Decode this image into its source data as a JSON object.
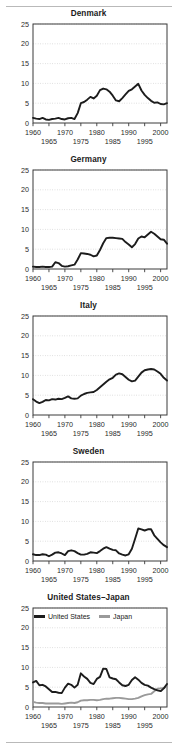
{
  "figure": {
    "background": "#ffffff",
    "rule_color": "#b9b9b9",
    "series_colors": {
      "primary": "#1c1c1c",
      "secondary": "#9a9a9a"
    }
  },
  "legend": {
    "united_states_label": "United States",
    "japan_label": "Japan"
  },
  "axes": {
    "y_ticks": [
      "0",
      "5",
      "10",
      "15",
      "20",
      "25"
    ],
    "x_ticks_upper": [
      "1960",
      "1970",
      "1980",
      "1990",
      "2000"
    ],
    "x_ticks_lower": [
      "1965",
      "1975",
      "1985",
      "1995"
    ]
  },
  "titles": {
    "denmark": "Denmark",
    "germany": "Germany",
    "italy": "Italy",
    "sweden": "Sweden",
    "us_japan": "United States–Japan"
  },
  "chart_data": [
    {
      "type": "line",
      "title": "Denmark",
      "xlabel": "",
      "ylabel": "",
      "xlim": [
        1960,
        2002
      ],
      "ylim": [
        0,
        25
      ],
      "grid": true,
      "legend_position": "none",
      "x": [
        1960,
        1961,
        1962,
        1963,
        1964,
        1965,
        1966,
        1967,
        1968,
        1969,
        1970,
        1971,
        1972,
        1973,
        1974,
        1975,
        1976,
        1977,
        1978,
        1979,
        1980,
        1981,
        1982,
        1983,
        1984,
        1985,
        1986,
        1987,
        1988,
        1989,
        1990,
        1991,
        1992,
        1993,
        1994,
        1995,
        1996,
        1997,
        1998,
        1999,
        2000,
        2001,
        2002
      ],
      "series": [
        {
          "name": "Denmark",
          "color": "#1c1c1c",
          "values": [
            1.3,
            1.1,
            1.0,
            1.3,
            0.9,
            0.8,
            1.0,
            1.1,
            1.3,
            1.0,
            0.9,
            1.2,
            1.3,
            1.0,
            2.5,
            5.0,
            5.3,
            5.9,
            6.6,
            6.2,
            6.9,
            8.3,
            8.7,
            8.5,
            7.9,
            6.9,
            5.7,
            5.5,
            6.3,
            7.2,
            8.1,
            8.5,
            9.2,
            9.9,
            8.2,
            7.1,
            6.3,
            5.6,
            5.1,
            5.2,
            4.8,
            4.7,
            5.0
          ]
        }
      ]
    },
    {
      "type": "line",
      "title": "Germany",
      "xlabel": "",
      "ylabel": "",
      "xlim": [
        1960,
        2002
      ],
      "ylim": [
        0,
        25
      ],
      "grid": true,
      "legend_position": "none",
      "x": [
        1960,
        1961,
        1962,
        1963,
        1964,
        1965,
        1966,
        1967,
        1968,
        1969,
        1970,
        1971,
        1972,
        1973,
        1974,
        1975,
        1976,
        1977,
        1978,
        1979,
        1980,
        1981,
        1982,
        1983,
        1984,
        1985,
        1986,
        1987,
        1988,
        1989,
        1990,
        1991,
        1992,
        1993,
        1994,
        1995,
        1996,
        1997,
        1998,
        1999,
        2000,
        2001,
        2002
      ],
      "series": [
        {
          "name": "Germany",
          "color": "#1c1c1c",
          "values": [
            0.6,
            0.5,
            0.5,
            0.6,
            0.5,
            0.5,
            0.6,
            1.7,
            1.5,
            0.8,
            0.6,
            0.7,
            0.9,
            1.1,
            2.4,
            4.0,
            3.9,
            3.8,
            3.6,
            3.2,
            3.4,
            4.8,
            6.5,
            7.8,
            7.9,
            7.9,
            7.8,
            7.7,
            7.6,
            6.8,
            6.2,
            5.5,
            6.3,
            7.7,
            8.2,
            8.0,
            8.7,
            9.4,
            8.9,
            8.2,
            7.5,
            7.4,
            6.4
          ]
        }
      ]
    },
    {
      "type": "line",
      "title": "Italy",
      "xlabel": "",
      "ylabel": "",
      "xlim": [
        1960,
        2002
      ],
      "ylim": [
        0,
        25
      ],
      "grid": true,
      "legend_position": "none",
      "x": [
        1960,
        1961,
        1962,
        1963,
        1964,
        1965,
        1966,
        1967,
        1968,
        1969,
        1970,
        1971,
        1972,
        1973,
        1974,
        1975,
        1976,
        1977,
        1978,
        1979,
        1980,
        1981,
        1982,
        1983,
        1984,
        1985,
        1986,
        1987,
        1988,
        1989,
        1990,
        1991,
        1992,
        1993,
        1994,
        1995,
        1996,
        1997,
        1998,
        1999,
        2000,
        2001,
        2002
      ],
      "series": [
        {
          "name": "Italy",
          "color": "#1c1c1c",
          "values": [
            4.0,
            3.4,
            3.0,
            3.3,
            3.8,
            3.7,
            4.0,
            3.9,
            4.1,
            4.0,
            4.3,
            4.7,
            4.2,
            4.1,
            4.2,
            4.9,
            5.3,
            5.6,
            5.7,
            5.8,
            6.3,
            7.0,
            7.7,
            8.4,
            9.0,
            9.4,
            10.2,
            10.5,
            10.3,
            9.6,
            8.9,
            8.5,
            8.7,
            9.7,
            10.7,
            11.3,
            11.5,
            11.6,
            11.5,
            11.0,
            10.4,
            9.4,
            8.7
          ]
        }
      ]
    },
    {
      "type": "line",
      "title": "Sweden",
      "xlabel": "",
      "ylabel": "",
      "xlim": [
        1960,
        2002
      ],
      "ylim": [
        0,
        25
      ],
      "grid": true,
      "legend_position": "none",
      "x": [
        1960,
        1961,
        1962,
        1963,
        1964,
        1965,
        1966,
        1967,
        1968,
        1969,
        1970,
        1971,
        1972,
        1973,
        1974,
        1975,
        1976,
        1977,
        1978,
        1979,
        1980,
        1981,
        1982,
        1983,
        1984,
        1985,
        1986,
        1987,
        1988,
        1989,
        1990,
        1991,
        1992,
        1993,
        1994,
        1995,
        1996,
        1997,
        1998,
        1999,
        2000,
        2001,
        2002
      ],
      "series": [
        {
          "name": "Sweden",
          "color": "#1c1c1c",
          "values": [
            1.7,
            1.5,
            1.5,
            1.7,
            1.6,
            1.2,
            1.6,
            2.1,
            2.2,
            1.9,
            1.5,
            2.5,
            2.7,
            2.5,
            2.0,
            1.6,
            1.6,
            1.8,
            2.2,
            2.1,
            2.0,
            2.5,
            3.1,
            3.5,
            3.1,
            2.8,
            2.7,
            1.9,
            1.6,
            1.4,
            1.7,
            3.1,
            5.6,
            8.2,
            8.0,
            7.7,
            8.0,
            8.0,
            6.5,
            5.6,
            4.7,
            4.0,
            3.5
          ]
        }
      ]
    },
    {
      "type": "line",
      "title": "United States–Japan",
      "xlabel": "",
      "ylabel": "",
      "xlim": [
        1960,
        2002
      ],
      "ylim": [
        0,
        25
      ],
      "grid": true,
      "legend_position": "top-left",
      "x": [
        1960,
        1961,
        1962,
        1963,
        1964,
        1965,
        1966,
        1967,
        1968,
        1969,
        1970,
        1971,
        1972,
        1973,
        1974,
        1975,
        1976,
        1977,
        1978,
        1979,
        1980,
        1981,
        1982,
        1983,
        1984,
        1985,
        1986,
        1987,
        1988,
        1989,
        1990,
        1991,
        1992,
        1993,
        1994,
        1995,
        1996,
        1997,
        1998,
        1999,
        2000,
        2001,
        2002
      ],
      "series": [
        {
          "name": "United States",
          "color": "#1c1c1c",
          "values": [
            6.2,
            6.6,
            5.5,
            5.6,
            5.2,
            4.5,
            3.8,
            3.8,
            3.6,
            3.5,
            4.9,
            5.9,
            5.6,
            4.9,
            5.6,
            8.5,
            7.7,
            7.1,
            6.1,
            5.8,
            7.1,
            7.6,
            9.7,
            9.6,
            7.5,
            7.2,
            7.0,
            6.2,
            5.5,
            5.3,
            5.6,
            6.8,
            7.5,
            6.9,
            6.1,
            5.6,
            5.4,
            4.9,
            4.5,
            4.2,
            4.0,
            4.7,
            5.8
          ]
        },
        {
          "name": "Japan",
          "color": "#9a9a9a",
          "values": [
            1.3,
            1.1,
            1.0,
            1.0,
            0.9,
            0.9,
            0.9,
            0.9,
            0.9,
            0.8,
            0.9,
            1.0,
            1.1,
            1.0,
            1.2,
            1.6,
            1.7,
            1.7,
            1.8,
            1.8,
            1.7,
            1.8,
            2.0,
            2.1,
            2.1,
            2.2,
            2.3,
            2.3,
            2.2,
            2.1,
            2.0,
            2.0,
            2.1,
            2.3,
            2.7,
            3.0,
            3.2,
            3.3,
            4.0,
            4.6,
            4.7,
            4.8,
            5.2
          ]
        }
      ]
    }
  ]
}
